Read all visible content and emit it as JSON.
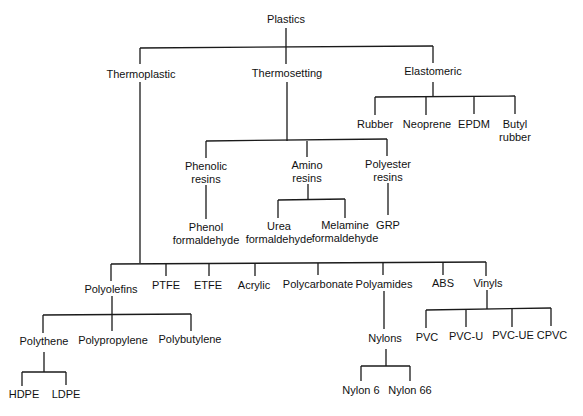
{
  "diagram": {
    "root": "Plastics",
    "categories": {
      "thermoplastic": "Thermoplastic",
      "thermosetting": "Thermosetting",
      "elastomeric": "Elastomeric"
    },
    "elastomeric_children": {
      "rubber": "Rubber",
      "neoprene": "Neoprene",
      "epdm": "EPDM",
      "butyl_1": "Butyl",
      "butyl_2": "rubber"
    },
    "thermosetting_children": {
      "phenolic_1": "Phenolic",
      "phenolic_2": "resins",
      "amino_1": "Amino",
      "amino_2": "resins",
      "polyester_1": "Polyester",
      "polyester_2": "resins"
    },
    "thermosetting_leaves": {
      "phenol_1": "Phenol",
      "phenol_2": "formaldehyde",
      "urea_1": "Urea",
      "urea_2": "formaldehyde",
      "melamine_1": "Melamine",
      "melamine_2": "formaldehyde",
      "grp": "GRP"
    },
    "thermoplastic_children": {
      "polyolefins": "Polyolefins",
      "ptfe": "PTFE",
      "etfe": "ETFE",
      "acrylic": "Acrylic",
      "polycarbonate": "Polycarbonate",
      "polyamides": "Polyamides",
      "abs": "ABS",
      "vinyls": "Vinyls"
    },
    "polyolefin_children": {
      "polythene": "Polythene",
      "polypropylene": "Polypropylene",
      "polybutylene": "Polybutylene"
    },
    "polythene_children": {
      "hdpe": "HDPE",
      "ldpe": "LDPE"
    },
    "polyamide_children": {
      "nylons": "Nylons"
    },
    "nylon_children": {
      "nylon6": "Nylon 6",
      "nylon66": "Nylon 66"
    },
    "vinyl_children": {
      "pvc": "PVC",
      "pvcu": "PVC-U",
      "pvcue": "PVC-UE",
      "cpvc": "CPVC"
    }
  }
}
